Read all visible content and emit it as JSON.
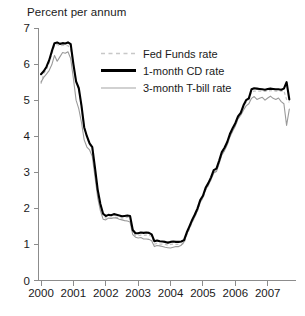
{
  "chart_data": {
    "type": "line",
    "title": "Percent per annum",
    "xlabel": "",
    "ylabel": "Percent per annum",
    "xlim": [
      2000,
      2007.75
    ],
    "ylim": [
      0,
      7
    ],
    "yticks": [
      0,
      1,
      2,
      3,
      4,
      5,
      6,
      7
    ],
    "xticks": [
      2000,
      2001,
      2002,
      2003,
      2004,
      2005,
      2006,
      2007
    ],
    "xtick_labels": [
      "2000",
      "2001",
      "2002",
      "2003",
      "2004",
      "2005",
      "2006",
      "2007"
    ],
    "ytick_labels": [
      "0",
      "1",
      "2",
      "3",
      "4",
      "5",
      "6",
      "7"
    ],
    "grid": false,
    "legend_position": "upper-center",
    "series": [
      {
        "name": "Fed Funds rate",
        "color": "#c4c4c4",
        "style": "dashed",
        "x": [
          2000.0,
          2000.083,
          2000.167,
          2000.25,
          2000.333,
          2000.417,
          2000.5,
          2000.583,
          2000.667,
          2000.75,
          2000.833,
          2000.917,
          2001.0,
          2001.083,
          2001.167,
          2001.25,
          2001.333,
          2001.417,
          2001.5,
          2001.583,
          2001.667,
          2001.75,
          2001.833,
          2001.917,
          2002.0,
          2002.083,
          2002.167,
          2002.25,
          2002.333,
          2002.417,
          2002.5,
          2002.583,
          2002.667,
          2002.75,
          2002.833,
          2002.917,
          2003.0,
          2003.083,
          2003.167,
          2003.25,
          2003.333,
          2003.417,
          2003.5,
          2003.583,
          2003.667,
          2003.75,
          2003.833,
          2003.917,
          2004.0,
          2004.083,
          2004.167,
          2004.25,
          2004.333,
          2004.417,
          2004.5,
          2004.583,
          2004.667,
          2004.75,
          2004.833,
          2004.917,
          2005.0,
          2005.083,
          2005.167,
          2005.25,
          2005.333,
          2005.417,
          2005.5,
          2005.583,
          2005.667,
          2005.75,
          2005.833,
          2005.917,
          2006.0,
          2006.083,
          2006.167,
          2006.25,
          2006.333,
          2006.417,
          2006.5,
          2006.583,
          2006.667,
          2006.75,
          2006.833,
          2006.917,
          2007.0,
          2007.083,
          2007.167,
          2007.25,
          2007.333,
          2007.417,
          2007.5,
          2007.583,
          2007.667
        ],
        "values": [
          5.45,
          5.73,
          5.85,
          6.02,
          6.27,
          6.53,
          6.54,
          6.5,
          6.52,
          6.51,
          6.51,
          6.4,
          5.98,
          5.49,
          5.31,
          4.8,
          4.21,
          3.97,
          3.77,
          3.65,
          3.07,
          2.49,
          2.09,
          1.82,
          1.73,
          1.74,
          1.73,
          1.75,
          1.75,
          1.75,
          1.73,
          1.74,
          1.75,
          1.75,
          1.34,
          1.24,
          1.24,
          1.26,
          1.25,
          1.26,
          1.26,
          1.22,
          1.01,
          1.03,
          1.01,
          1.01,
          1.0,
          0.98,
          1.0,
          1.01,
          1.0,
          1.0,
          1.0,
          1.03,
          1.26,
          1.43,
          1.61,
          1.76,
          1.93,
          2.16,
          2.28,
          2.5,
          2.63,
          2.79,
          3.0,
          3.04,
          3.26,
          3.5,
          3.62,
          3.78,
          4.0,
          4.16,
          4.29,
          4.49,
          4.59,
          4.79,
          4.94,
          4.99,
          5.24,
          5.25,
          5.25,
          5.25,
          5.25,
          5.24,
          5.25,
          5.26,
          5.26,
          5.25,
          5.25,
          5.25,
          5.26,
          5.02,
          4.94
        ]
      },
      {
        "name": "1-month CD rate",
        "color": "#000000",
        "style": "solid-thick",
        "x": [
          2000.0,
          2000.083,
          2000.167,
          2000.25,
          2000.333,
          2000.417,
          2000.5,
          2000.583,
          2000.667,
          2000.75,
          2000.833,
          2000.917,
          2001.0,
          2001.083,
          2001.167,
          2001.25,
          2001.333,
          2001.417,
          2001.5,
          2001.583,
          2001.667,
          2001.75,
          2001.833,
          2001.917,
          2002.0,
          2002.083,
          2002.167,
          2002.25,
          2002.333,
          2002.417,
          2002.5,
          2002.583,
          2002.667,
          2002.75,
          2002.833,
          2002.917,
          2003.0,
          2003.083,
          2003.167,
          2003.25,
          2003.333,
          2003.417,
          2003.5,
          2003.583,
          2003.667,
          2003.75,
          2003.833,
          2003.917,
          2004.0,
          2004.083,
          2004.167,
          2004.25,
          2004.333,
          2004.417,
          2004.5,
          2004.583,
          2004.667,
          2004.75,
          2004.833,
          2004.917,
          2005.0,
          2005.083,
          2005.167,
          2005.25,
          2005.333,
          2005.417,
          2005.5,
          2005.583,
          2005.667,
          2005.75,
          2005.833,
          2005.917,
          2006.0,
          2006.083,
          2006.167,
          2006.25,
          2006.333,
          2006.417,
          2006.5,
          2006.583,
          2006.667,
          2006.75,
          2006.833,
          2006.917,
          2007.0,
          2007.083,
          2007.167,
          2007.25,
          2007.333,
          2007.417,
          2007.5,
          2007.583,
          2007.667
        ],
        "values": [
          5.72,
          5.8,
          5.92,
          6.1,
          6.35,
          6.58,
          6.6,
          6.56,
          6.58,
          6.57,
          6.6,
          6.55,
          6.0,
          5.52,
          5.33,
          4.85,
          4.25,
          4.0,
          3.8,
          3.7,
          3.12,
          2.52,
          2.12,
          1.85,
          1.79,
          1.82,
          1.81,
          1.84,
          1.82,
          1.8,
          1.78,
          1.79,
          1.8,
          1.79,
          1.4,
          1.31,
          1.31,
          1.33,
          1.32,
          1.33,
          1.32,
          1.28,
          1.09,
          1.11,
          1.09,
          1.08,
          1.07,
          1.05,
          1.07,
          1.08,
          1.07,
          1.07,
          1.08,
          1.12,
          1.33,
          1.5,
          1.68,
          1.83,
          2.0,
          2.23,
          2.35,
          2.57,
          2.7,
          2.86,
          3.06,
          3.1,
          3.32,
          3.56,
          3.68,
          3.84,
          4.06,
          4.22,
          4.36,
          4.55,
          4.65,
          4.85,
          5.0,
          5.05,
          5.3,
          5.33,
          5.32,
          5.31,
          5.3,
          5.29,
          5.31,
          5.32,
          5.31,
          5.3,
          5.3,
          5.29,
          5.32,
          5.5,
          5.02
        ]
      },
      {
        "name": "3-month T-bill rate",
        "color": "#9a9a9a",
        "style": "solid-thin",
        "x": [
          2000.0,
          2000.083,
          2000.167,
          2000.25,
          2000.333,
          2000.417,
          2000.5,
          2000.583,
          2000.667,
          2000.75,
          2000.833,
          2000.917,
          2001.0,
          2001.083,
          2001.167,
          2001.25,
          2001.333,
          2001.417,
          2001.5,
          2001.583,
          2001.667,
          2001.75,
          2001.833,
          2001.917,
          2002.0,
          2002.083,
          2002.167,
          2002.25,
          2002.333,
          2002.417,
          2002.5,
          2002.583,
          2002.667,
          2002.75,
          2002.833,
          2002.917,
          2003.0,
          2003.083,
          2003.167,
          2003.25,
          2003.333,
          2003.417,
          2003.5,
          2003.583,
          2003.667,
          2003.75,
          2003.833,
          2003.917,
          2004.0,
          2004.083,
          2004.167,
          2004.25,
          2004.333,
          2004.417,
          2004.5,
          2004.583,
          2004.667,
          2004.75,
          2004.833,
          2004.917,
          2005.0,
          2005.083,
          2005.167,
          2005.25,
          2005.333,
          2005.417,
          2005.5,
          2005.583,
          2005.667,
          2005.75,
          2005.833,
          2005.917,
          2006.0,
          2006.083,
          2006.167,
          2006.25,
          2006.333,
          2006.417,
          2006.5,
          2006.583,
          2006.667,
          2006.75,
          2006.833,
          2006.917,
          2007.0,
          2007.083,
          2007.167,
          2007.25,
          2007.333,
          2007.417,
          2007.5,
          2007.583,
          2007.667
        ],
        "values": [
          5.5,
          5.63,
          5.72,
          5.82,
          5.98,
          6.24,
          6.08,
          6.2,
          6.32,
          6.3,
          6.34,
          6.15,
          5.6,
          5.0,
          4.76,
          4.38,
          3.9,
          3.7,
          3.62,
          3.44,
          2.87,
          2.3,
          1.94,
          1.7,
          1.68,
          1.73,
          1.72,
          1.74,
          1.73,
          1.7,
          1.68,
          1.66,
          1.65,
          1.62,
          1.27,
          1.2,
          1.18,
          1.19,
          1.15,
          1.15,
          1.14,
          1.1,
          0.94,
          0.97,
          0.96,
          0.94,
          0.92,
          0.91,
          0.9,
          0.92,
          0.94,
          0.94,
          0.98,
          1.07,
          1.28,
          1.45,
          1.62,
          1.77,
          1.94,
          2.18,
          2.3,
          2.52,
          2.65,
          2.8,
          2.98,
          3.02,
          3.24,
          3.48,
          3.6,
          3.76,
          3.98,
          4.14,
          4.28,
          4.48,
          4.58,
          4.72,
          4.84,
          4.9,
          5.05,
          5.1,
          5.02,
          5.05,
          5.08,
          5.0,
          5.06,
          5.11,
          5.05,
          5.02,
          5.06,
          4.96,
          4.9,
          4.3,
          4.75
        ]
      }
    ]
  },
  "legend": {
    "entries": [
      {
        "label": "Fed Funds rate"
      },
      {
        "label": "1-month CD rate"
      },
      {
        "label": "3-month T-bill rate"
      }
    ]
  },
  "footer": {
    "smudge": " "
  }
}
